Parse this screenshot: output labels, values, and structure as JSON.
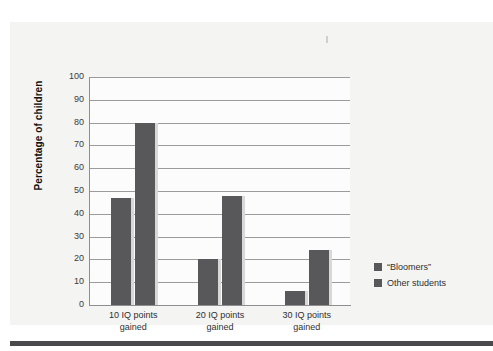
{
  "figure": {
    "background_color": "#f4f4f3",
    "plot_background_color": "#fcfcfc",
    "bar_color": "#58585a",
    "grid_color": "#9b9b9b",
    "rule_color": "#4a4a4c"
  },
  "chart_data": {
    "type": "bar",
    "title": "",
    "subtitle": "",
    "xlabel": "",
    "ylabel": "Percentage of children",
    "ylim": [
      0,
      100
    ],
    "ytick_step": 10,
    "yticks": [
      100,
      90,
      80,
      70,
      60,
      50,
      40,
      30,
      20,
      10,
      0
    ],
    "ytick_labels": [
      "100",
      "90",
      "80",
      "70",
      "60",
      "50",
      "40",
      "30",
      "20",
      "10",
      "0"
    ],
    "grid": true,
    "grid_axis": "y",
    "legend_position": "right",
    "categories": [
      "10 IQ points\ngained",
      "20 IQ points\ngained",
      "30 IQ points\ngained"
    ],
    "category_lines": [
      [
        "10 IQ points",
        "gained"
      ],
      [
        "20 IQ points",
        "gained"
      ],
      [
        "30 IQ points",
        "gained"
      ]
    ],
    "series": [
      {
        "name": "“Bloomers”",
        "color": "#58585a",
        "values": [
          47,
          20,
          6
        ]
      },
      {
        "name": "Other students",
        "color": "#58585a",
        "values": [
          80,
          48,
          24
        ]
      }
    ]
  },
  "legend": {
    "entries": [
      {
        "label": "“Bloomers”"
      },
      {
        "label": "Other students"
      }
    ]
  }
}
